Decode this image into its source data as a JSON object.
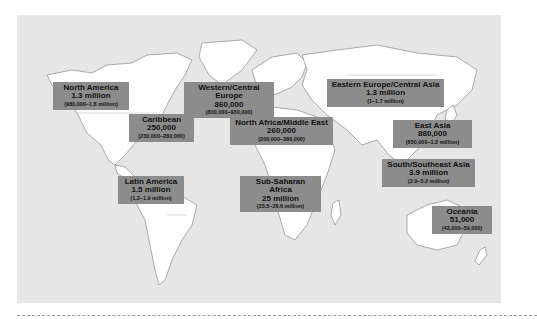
{
  "map": {
    "title": "",
    "background_color": "#e6e6e6",
    "label_color": "#8c8c8c",
    "regions": [
      {
        "name": "North America",
        "value": "1.3 million",
        "range": "(980,000–1.8 million)"
      },
      {
        "name": "Caribbean",
        "value": "250,000",
        "range": "(230,000–280,000)"
      },
      {
        "name": "Western/Central Europe",
        "value": "860,000",
        "range": "(800,000–930,000)"
      },
      {
        "name": "North Africa/Middle East",
        "value": "260,000",
        "range": "(200,000–380,000)"
      },
      {
        "name": "Eastern Europe/Central Asia",
        "value": "1.3 million",
        "range": "(1–1.7 million)"
      },
      {
        "name": "East Asia",
        "value": "880,000",
        "range": "(650,000–1.2 million)"
      },
      {
        "name": "South/Southeast Asia",
        "value": "3.9 million",
        "range": "(2.9–5.2 million)"
      },
      {
        "name": "Latin America",
        "value": "1.5 million",
        "range": "(1.2–1.9 million)"
      },
      {
        "name": "Sub-Saharan Africa",
        "value": "25 million",
        "range": "(23.5–26.6 million)"
      },
      {
        "name": "Oceania",
        "value": "51,000",
        "range": "(43,000–59,000)"
      }
    ]
  }
}
